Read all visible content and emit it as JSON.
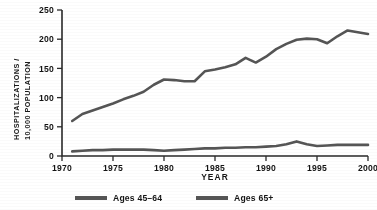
{
  "chart_data": {
    "type": "line",
    "title": "",
    "xlabel": "YEAR",
    "ylabel_line1": "HOSPITALIZATIONS /",
    "ylabel_line2": "10,000 POPULATION",
    "xlim": [
      1970,
      2000
    ],
    "ylim": [
      0,
      250
    ],
    "xticks": [
      "1970",
      "1975",
      "1980",
      "1985",
      "1990",
      "1995",
      "2000"
    ],
    "xtick_values": [
      1970,
      1975,
      1980,
      1985,
      1990,
      1995,
      2000
    ],
    "yticks": [
      "0",
      "50",
      "100",
      "150",
      "200",
      "250"
    ],
    "ytick_values": [
      0,
      50,
      100,
      150,
      200,
      250
    ],
    "grid": false,
    "legend_position": "below",
    "x": [
      1971,
      1972,
      1973,
      1974,
      1975,
      1976,
      1977,
      1978,
      1979,
      1980,
      1981,
      1982,
      1983,
      1984,
      1985,
      1986,
      1987,
      1988,
      1989,
      1990,
      1991,
      1992,
      1993,
      1994,
      1995,
      1996,
      1997,
      1998,
      1999,
      2000
    ],
    "series": [
      {
        "name": "Ages 45–64",
        "color": "#555555",
        "values": [
          60,
          72,
          78,
          84,
          90,
          97,
          103,
          110,
          122,
          131,
          130,
          128,
          128,
          145,
          148,
          152,
          157,
          168,
          160,
          170,
          183,
          192,
          199,
          201,
          200,
          193,
          205,
          215,
          212,
          209
        ]
      },
      {
        "name": "Ages 65+",
        "color": "#555555",
        "values": [
          8,
          9,
          10,
          10,
          11,
          11,
          11,
          11,
          10,
          9,
          10,
          11,
          12,
          13,
          13,
          14,
          14,
          15,
          15,
          16,
          17,
          20,
          25,
          20,
          17,
          18,
          19,
          19,
          19,
          19
        ]
      }
    ],
    "legend": [
      {
        "label": "Ages 45–64",
        "color": "#555555"
      },
      {
        "label": "Ages 65+",
        "color": "#555555"
      }
    ]
  }
}
